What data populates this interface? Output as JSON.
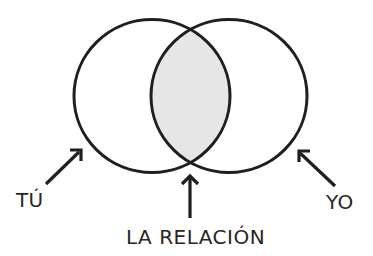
{
  "diagram": {
    "type": "venn",
    "sets": [
      {
        "id": "left",
        "label": "TÚ"
      },
      {
        "id": "right",
        "label": "YO"
      }
    ],
    "intersection": {
      "label": "LA RELACIÓN",
      "fill": "#e6e6e6"
    },
    "colors": {
      "stroke": "#1f1f1f",
      "intersection_fill": "#e6e6e6",
      "text": "#262626",
      "background": "#ffffff"
    }
  },
  "labels": {
    "left": "TÚ",
    "right": "YO",
    "center": "LA RELACIÓN"
  }
}
